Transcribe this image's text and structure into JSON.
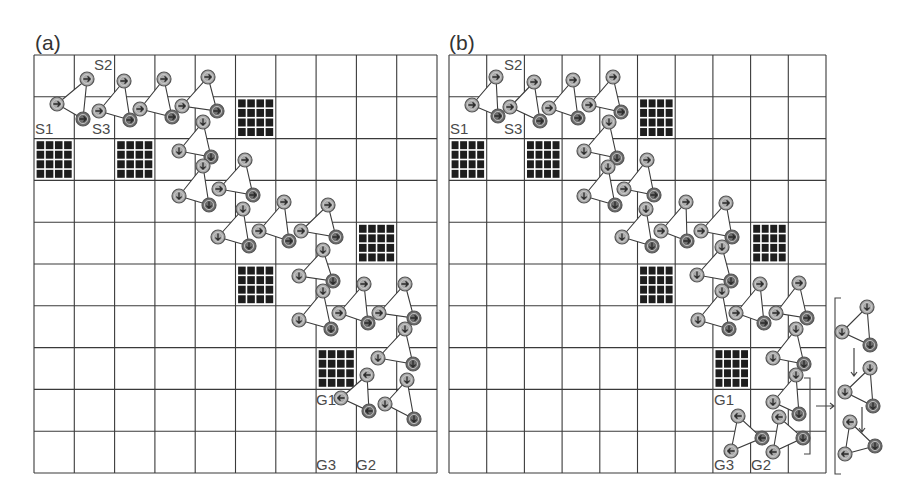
{
  "figure": {
    "panels": [
      {
        "id": "a",
        "label": "(a)",
        "grid": {
          "x0": 34,
          "y0": 55,
          "x1": 437,
          "y1": 473,
          "cols": 10,
          "rows": 10
        },
        "obstacles": [
          [
            5,
            1
          ],
          [
            0,
            2
          ],
          [
            2,
            2
          ],
          [
            8,
            4
          ],
          [
            5,
            5
          ],
          [
            7,
            7
          ]
        ],
        "labels": [
          {
            "text": "S2",
            "x": 94,
            "y": 70
          },
          {
            "text": "S1",
            "x": 35,
            "y": 134
          },
          {
            "text": "S3",
            "x": 92,
            "y": 134
          },
          {
            "text": "G1",
            "x": 316,
            "y": 405
          },
          {
            "text": "G3",
            "x": 316,
            "y": 470
          },
          {
            "text": "G2",
            "x": 356,
            "y": 470
          }
        ],
        "formations": [
          {
            "L": [
              57,
              104
            ],
            "T": [
              87,
              79
            ],
            "B": [
              83,
              119
            ],
            "dir": "right",
            "ldir": "right",
            "tdir": "right",
            "bdir": "right"
          },
          {
            "L": [
              99,
              111
            ],
            "T": [
              124,
              81
            ],
            "B": [
              130,
              120
            ],
            "dir": "right"
          },
          {
            "L": [
              140,
              109
            ],
            "T": [
              164,
              79
            ],
            "B": [
              172,
              117
            ],
            "dir": "right"
          },
          {
            "L": [
              182,
              106
            ],
            "T": [
              208,
              77
            ],
            "B": [
              217,
              111
            ],
            "dir": "right"
          },
          {
            "L": [
              179,
              151
            ],
            "T": [
              203,
              122
            ],
            "B": [
              211,
              157
            ],
            "dir": "down"
          },
          {
            "L": [
              179,
              196
            ],
            "T": [
              203,
              166
            ],
            "B": [
              209,
              205
            ],
            "dir": "down"
          },
          {
            "L": [
              219,
              189
            ],
            "T": [
              245,
              160
            ],
            "B": [
              253,
              195
            ],
            "dir": "right"
          },
          {
            "L": [
              218,
              237
            ],
            "T": [
              243,
              209
            ],
            "B": [
              249,
              246
            ],
            "dir": "down"
          },
          {
            "L": [
              259,
              231
            ],
            "T": [
              284,
              202
            ],
            "B": [
              289,
              241
            ],
            "dir": "right"
          },
          {
            "L": [
              301,
              231
            ],
            "T": [
              328,
              205
            ],
            "B": [
              336,
              237
            ],
            "dir": "right"
          },
          {
            "L": [
              299,
              276
            ],
            "T": [
              323,
              250
            ],
            "B": [
              333,
              281
            ],
            "dir": "down"
          },
          {
            "L": [
              299,
              320
            ],
            "T": [
              323,
              291
            ],
            "B": [
              331,
              329
            ],
            "dir": "down"
          },
          {
            "L": [
              339,
              313
            ],
            "T": [
              364,
              284
            ],
            "B": [
              368,
              323
            ],
            "dir": "right"
          },
          {
            "L": [
              379,
              313
            ],
            "T": [
              405,
              284
            ],
            "B": [
              414,
              318
            ],
            "dir": "right"
          },
          {
            "L": [
              378,
              358
            ],
            "T": [
              405,
              329
            ],
            "B": [
              413,
              364
            ],
            "dir": "down"
          },
          {
            "L": [
              341,
              398
            ],
            "T": [
              367,
              375
            ],
            "B": [
              369,
              411
            ],
            "dir": "left"
          },
          {
            "L": [
              385,
              404
            ],
            "T": [
              407,
              380
            ],
            "B": [
              414,
              419
            ],
            "dir": "down"
          }
        ]
      },
      {
        "id": "b",
        "label": "(b)",
        "grid": {
          "x0": 449,
          "y0": 55,
          "x1": 826,
          "y1": 473,
          "cols": 10,
          "rows": 10
        },
        "obstacles": [
          [
            5,
            1
          ],
          [
            0,
            2
          ],
          [
            2,
            2
          ],
          [
            8,
            4
          ],
          [
            5,
            5
          ],
          [
            7,
            7
          ]
        ],
        "labels": [
          {
            "text": "S2",
            "x": 504,
            "y": 70
          },
          {
            "text": "S1",
            "x": 450,
            "y": 134
          },
          {
            "text": "S3",
            "x": 504,
            "y": 134
          },
          {
            "text": "G1",
            "x": 714,
            "y": 405
          },
          {
            "text": "G3",
            "x": 714,
            "y": 470
          },
          {
            "text": "G2",
            "x": 751,
            "y": 470
          }
        ],
        "formations": [
          {
            "L": [
              472,
              105
            ],
            "T": [
              496,
              77
            ],
            "B": [
              498,
              116
            ],
            "dir": "right"
          },
          {
            "L": [
              510,
              107
            ],
            "T": [
              534,
              82
            ],
            "B": [
              540,
              121
            ],
            "dir": "right"
          },
          {
            "L": [
              549,
              108
            ],
            "T": [
              573,
              80
            ],
            "B": [
              578,
              118
            ],
            "dir": "right"
          },
          {
            "L": [
              589,
              105
            ],
            "T": [
              613,
              77
            ],
            "B": [
              621,
              112
            ],
            "dir": "right"
          },
          {
            "L": [
              584,
              151
            ],
            "T": [
              609,
              122
            ],
            "B": [
              617,
              158
            ],
            "dir": "down"
          },
          {
            "L": [
              584,
              196
            ],
            "T": [
              608,
              167
            ],
            "B": [
              615,
              205
            ],
            "dir": "down"
          },
          {
            "L": [
              624,
              189
            ],
            "T": [
              647,
              160
            ],
            "B": [
              654,
              195
            ],
            "dir": "right"
          },
          {
            "L": [
              622,
              237
            ],
            "T": [
              646,
              209
            ],
            "B": [
              652,
              246
            ],
            "dir": "down"
          },
          {
            "L": [
              661,
              231
            ],
            "T": [
              686,
              202
            ],
            "B": [
              687,
              241
            ],
            "dir": "right"
          },
          {
            "L": [
              701,
              231
            ],
            "T": [
              726,
              203
            ],
            "B": [
              732,
              237
            ],
            "dir": "right"
          },
          {
            "L": [
              697,
              275
            ],
            "T": [
              722,
              247
            ],
            "B": [
              731,
              281
            ],
            "dir": "down"
          },
          {
            "L": [
              698,
              320
            ],
            "T": [
              722,
              291
            ],
            "B": [
              729,
              329
            ],
            "dir": "down"
          },
          {
            "L": [
              736,
              313
            ],
            "T": [
              760,
              284
            ],
            "B": [
              764,
              323
            ],
            "dir": "right"
          },
          {
            "L": [
              776,
              313
            ],
            "T": [
              799,
              283
            ],
            "B": [
              807,
              318
            ],
            "dir": "right"
          },
          {
            "L": [
              773,
              358
            ],
            "T": [
              796,
              329
            ],
            "B": [
              804,
              364
            ],
            "dir": "down"
          },
          {
            "L": [
              773,
              402
            ],
            "T": [
              796,
              375
            ],
            "B": [
              799,
              414
            ],
            "dir": "down"
          },
          {
            "L": [
              731,
              451
            ],
            "T": [
              738,
              416
            ],
            "B": [
              762,
              438
            ],
            "dir": "left"
          },
          {
            "L": [
              773,
              452
            ],
            "T": [
              779,
              417
            ],
            "B": [
              803,
              438
            ],
            "dir": "left-down"
          }
        ],
        "inset": {
          "bracket_small": {
            "x": 810,
            "y0": 378,
            "y1": 454
          },
          "arrow": {
            "x0": 816,
            "x1": 834,
            "y": 406
          },
          "bracket_large": {
            "x": 835,
            "y0": 298,
            "y1": 474
          },
          "formations": [
            {
              "L": [
                842,
                332
              ],
              "T": [
                867,
                307
              ],
              "B": [
                870,
                345
              ],
              "dir": "down"
            },
            {
              "L": [
                845,
                392
              ],
              "T": [
                870,
                368
              ],
              "B": [
                873,
                406
              ],
              "dir": "down"
            },
            {
              "L": [
                845,
                454
              ],
              "T": [
                850,
                422
              ],
              "B": [
                875,
                446
              ],
              "dir": "mixed"
            }
          ],
          "motion_arrows": [
            {
              "x": 854,
              "y0": 348,
              "y1": 376
            },
            {
              "x": 862,
              "y0": 407,
              "y1": 432
            }
          ]
        }
      }
    ],
    "colors": {
      "grid_line": "#3a3a3a",
      "obstacle": "#1e1e1e",
      "robot_light": "#a9a9a9",
      "robot_dark": "#6e6e6e",
      "robot_ring": "#555555",
      "label": "#4a4a4a"
    }
  }
}
